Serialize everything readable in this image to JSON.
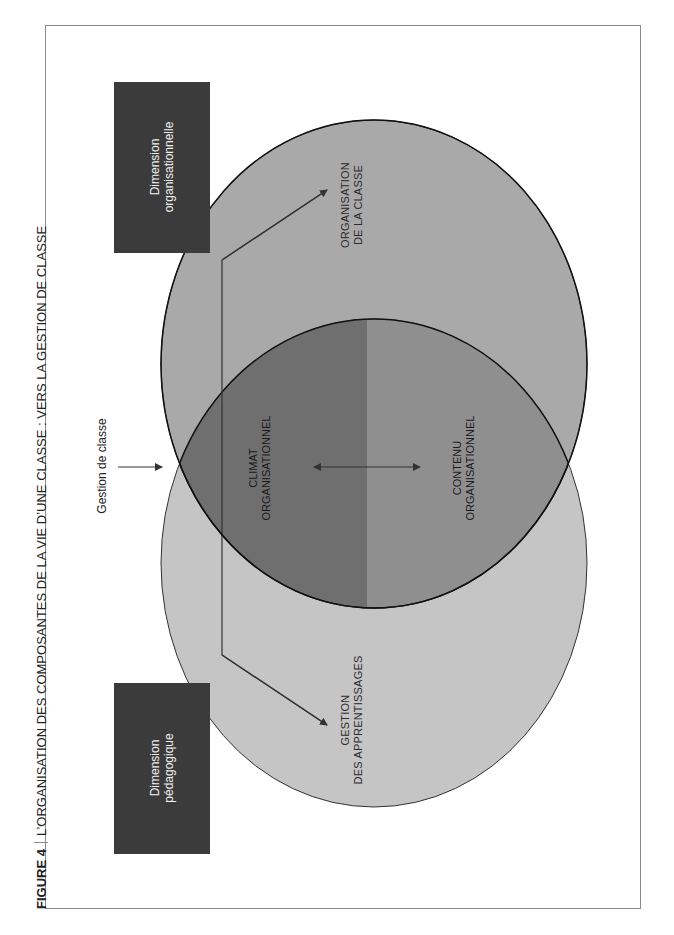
{
  "caption": {
    "figure_label": "FIGURE 4",
    "title": "L’ORGANISATION DES COMPOSANTES DE LA VIE D’UNE CLASSE : VERS LA GESTION DE CLASSE"
  },
  "boxes": {
    "organisational": {
      "line1": "Dimension",
      "line2": "organisationnelle"
    },
    "pedagogical": {
      "line1": "Dimension",
      "line2": "pédagogique"
    }
  },
  "circles": {
    "top": {
      "line1": "ORGANISATION",
      "line2": "DE LA CLASSE",
      "color": "#a8a8a8"
    },
    "bottom": {
      "line1": "GESTION",
      "line2": "DES APPRENTISSAGES",
      "color": "#c4c4c4"
    }
  },
  "overlap": {
    "left": {
      "line1": "CLIMAT",
      "line2": "ORGANISATIONNEL",
      "color": "#6e6e6e"
    },
    "right": {
      "line1": "CONTENU",
      "line2": "ORGANISATIONNEL",
      "color": "#8e8e8e"
    }
  },
  "pointer_label": "Gestion de classe",
  "colors": {
    "box": "#3a3a3a",
    "line": "#333333",
    "frame": "#8a8a8a"
  }
}
